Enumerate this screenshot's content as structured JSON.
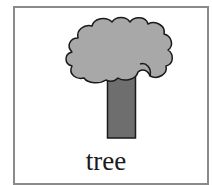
{
  "card": {
    "label": "tree",
    "illustration": "tree-icon"
  },
  "colors": {
    "border": "#8a8a8a",
    "canopy_fill": "#a8a8a8",
    "trunk_fill": "#6e6e6e",
    "outline": "#1a1a1a",
    "label_text": "#1a1a1a",
    "background": "#ffffff"
  }
}
